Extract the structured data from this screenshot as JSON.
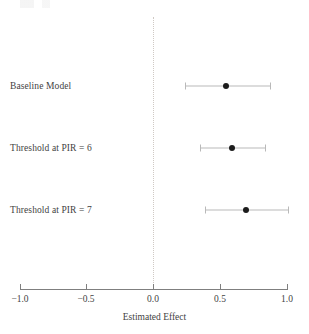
{
  "chart_data": {
    "type": "scatter",
    "subtype": "forest-plot",
    "title": "",
    "xlabel": "Estimated Effect",
    "ylabel": "",
    "xlim": [
      -1.0,
      1.0
    ],
    "xticks": [
      -1.0,
      -0.5,
      0.0,
      0.5,
      1.0
    ],
    "xtick_labels": [
      "−1.0",
      "−0.5",
      "0.0",
      "0.5",
      "1.0"
    ],
    "grid": false,
    "legend": null,
    "reference_line": {
      "value": 0.0,
      "style": "dotted",
      "color": "#cfc9c4",
      "orientation": "vertical"
    },
    "categories": [
      "Baseline Model",
      "Threshold at PIR = 6",
      "Threshold at PIR = 7"
    ],
    "values": [
      0.55,
      0.59,
      0.7
    ],
    "ci_low": [
      0.24,
      0.35,
      0.39
    ],
    "ci_high": [
      0.88,
      0.84,
      1.01
    ],
    "point_color": "#1c1c1c",
    "interval_color": "#b9b9b9",
    "rows": [
      {
        "label": "Baseline Model",
        "estimate": 0.55,
        "ci_low": 0.24,
        "ci_high": 0.88,
        "row_top_px": 74
      },
      {
        "label": "Threshold at PIR = 6",
        "estimate": 0.59,
        "ci_low": 0.35,
        "ci_high": 0.84,
        "row_top_px": 136
      },
      {
        "label": "Threshold at PIR = 7",
        "estimate": 0.7,
        "ci_low": 0.39,
        "ci_high": 1.01,
        "row_top_px": 198
      }
    ]
  },
  "axis": {
    "title": "Estimated Effect",
    "ticks": [
      {
        "value": -1.0,
        "label": "−1.0",
        "x_px": 20
      },
      {
        "value": -0.5,
        "label": "−0.5",
        "x_px": 86
      },
      {
        "value": 0.0,
        "label": "0.0",
        "x_px": 153
      },
      {
        "value": 0.5,
        "label": "0.5",
        "x_px": 220
      },
      {
        "value": 1.0,
        "label": "1.0",
        "x_px": 287
      }
    ]
  },
  "geometry": {
    "x_zero_px": 153,
    "px_per_unit": 133.5
  }
}
